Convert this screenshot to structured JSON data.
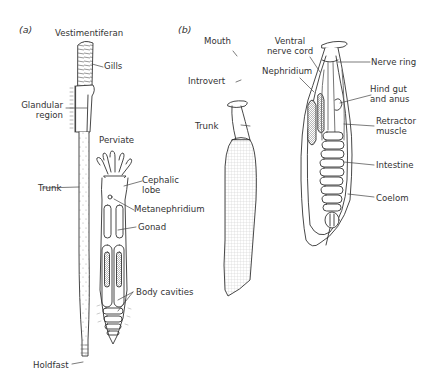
{
  "figure": {
    "panels": [
      {
        "id": "a",
        "label": "(a)",
        "organisms": [
          {
            "name": "Vestimentiferan",
            "labels": [
              "Gills",
              "Glandular\nregion",
              "Trunk",
              "Holdfast"
            ]
          },
          {
            "name": "Perviate",
            "labels": [
              "Cephalic\nlobe",
              "Metanephridium",
              "Gonad",
              "Body cavities"
            ]
          }
        ]
      },
      {
        "id": "b",
        "label": "(b)",
        "organisms": [
          {
            "name": "Priapulid-like worm (external)",
            "labels": [
              "Mouth",
              "Introvert",
              "Trunk"
            ]
          },
          {
            "name": "Internal anatomy",
            "labels": [
              "Ventral\nnerve cord",
              "Nerve ring",
              "Nephridium",
              "Hind gut\nand anus",
              "Retractor\nmuscle",
              "Intestine",
              "Coelom"
            ]
          }
        ]
      }
    ]
  },
  "labels": {
    "panel_a": "(a)",
    "panel_b": "(b)",
    "vestimentiferan": "Vestimentiferan",
    "gills": "Gills",
    "glandular_region": "Glandular\nregion",
    "trunk_a": "Trunk",
    "holdfast": "Holdfast",
    "perviate": "Perviate",
    "cephalic_lobe": "Cephalic\nlobe",
    "metanephridium": "Metanephridium",
    "gonad": "Gonad",
    "body_cavities": "Body cavities",
    "mouth": "Mouth",
    "introvert": "Introvert",
    "trunk_b": "Trunk",
    "ventral_nerve_cord": "Ventral\nnerve cord",
    "nerve_ring": "Nerve ring",
    "nephridium": "Nephridium",
    "hind_gut": "Hind gut\nand anus",
    "retractor_muscle": "Retractor\nmuscle",
    "intestine": "Intestine",
    "coelom": "Coelom"
  },
  "colors": {
    "line": "#333333",
    "shade": "#bbbbbb",
    "background": "#ffffff"
  }
}
